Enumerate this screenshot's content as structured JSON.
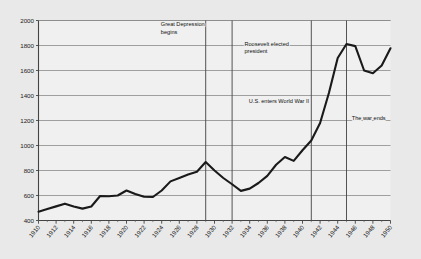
{
  "chart_data": {
    "type": "line",
    "title": "",
    "subtitle": "",
    "xlabel": "",
    "ylabel": "",
    "xlim": [
      1910,
      1950
    ],
    "ylim": [
      400,
      2000
    ],
    "grid": true,
    "legend": "none",
    "y_ticks": [
      400,
      600,
      800,
      1000,
      1200,
      1400,
      1600,
      1800,
      2000
    ],
    "y_tick_labels": [
      "400",
      "600",
      "800",
      "1000",
      "1200",
      "1400",
      "1600",
      "1800",
      "2000"
    ],
    "x_ticks": [
      1910,
      1912,
      1914,
      1916,
      1918,
      1920,
      1922,
      1924,
      1926,
      1928,
      1930,
      1932,
      1934,
      1936,
      1938,
      1940,
      1942,
      1944,
      1946,
      1948,
      1950
    ],
    "x_tick_labels": [
      "1910",
      "1912",
      "1914",
      "1916",
      "1918",
      "1920",
      "1922",
      "1924",
      "1926",
      "1928",
      "1930",
      "1932",
      "1934",
      "1936",
      "1938",
      "1940",
      "1942",
      "1944",
      "1946",
      "1948",
      "1950"
    ],
    "x_minor_ticks": [
      1911,
      1913,
      1915,
      1917,
      1919,
      1921,
      1923,
      1925,
      1927,
      1929,
      1931,
      1933,
      1935,
      1937,
      1939,
      1941,
      1943,
      1945,
      1947,
      1949
    ],
    "x": [
      1910,
      1911,
      1912,
      1913,
      1914,
      1915,
      1916,
      1917,
      1918,
      1919,
      1920,
      1921,
      1922,
      1923,
      1924,
      1925,
      1926,
      1927,
      1928,
      1929,
      1930,
      1931,
      1932,
      1933,
      1934,
      1935,
      1936,
      1937,
      1938,
      1939,
      1940,
      1941,
      1942,
      1943,
      1944,
      1945,
      1946,
      1947,
      1948,
      1949,
      1950
    ],
    "values": [
      470,
      492,
      513,
      535,
      512,
      495,
      512,
      596,
      594,
      600,
      640,
      612,
      590,
      588,
      640,
      713,
      740,
      768,
      790,
      868,
      800,
      740,
      690,
      637,
      655,
      700,
      757,
      846,
      908,
      877,
      962,
      1040,
      1180,
      1420,
      1700,
      1812,
      1795,
      1600,
      1578,
      1640,
      1778
    ],
    "series_color": "#1a1a1a",
    "series_linewidth": 2.1,
    "plot_background": "#f0f0f0",
    "grid_color": "#8a8a8a",
    "axis_color": "#555555",
    "annotation_line_color": "#4a4a4a",
    "annotations": [
      {
        "id": "great-depression",
        "text_lines": [
          "Great Depression",
          "begins"
        ],
        "line_x": 1929,
        "text_x": 1923.9,
        "text_y": 1955
      },
      {
        "id": "roosevelt-elected",
        "text_lines": [
          "Roosevelt elected",
          "president"
        ],
        "line_x": 1932,
        "text_x": 1933.4,
        "text_y": 1800
      },
      {
        "id": "us-enters-wwii",
        "text_lines": [
          "U.S. enters World War II"
        ],
        "line_x": 1941,
        "text_x": 1933.9,
        "text_y": 1340
      },
      {
        "id": "war-ends",
        "text_lines": [
          "The war ends"
        ],
        "line_x": 1945,
        "text_x": 1945.6,
        "text_y": 1205
      }
    ]
  }
}
